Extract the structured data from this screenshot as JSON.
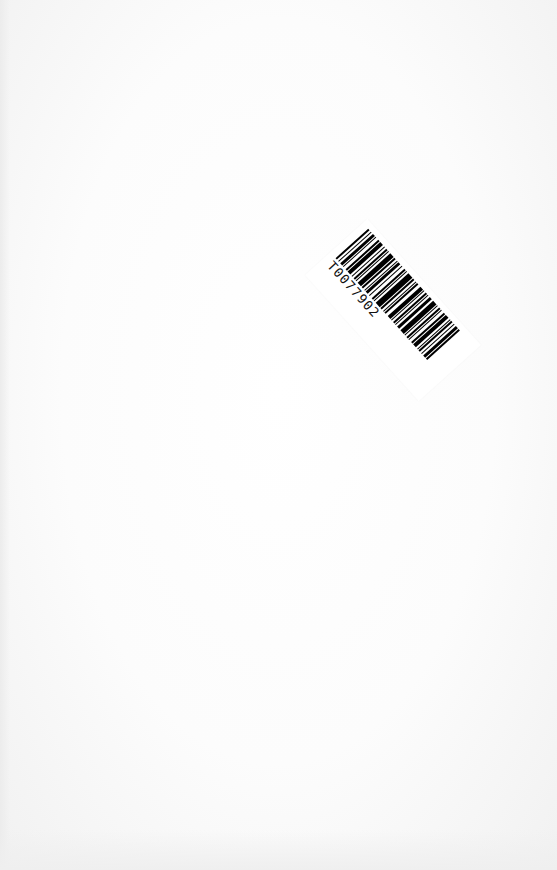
{
  "document": {
    "type": "scanned blank page",
    "background_color": "#fdfdfd"
  },
  "barcode_sticker": {
    "code_text": "T0077902",
    "rotation_deg": 48,
    "bar_color": "#000000",
    "label_color": "#ffffff"
  }
}
